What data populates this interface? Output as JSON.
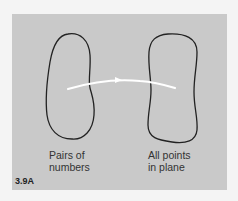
{
  "figure": {
    "number": "3.9A",
    "background_color": "#c9c9c9",
    "outline_color": "#222222",
    "arrow_color": "#ffffff"
  },
  "left_set": {
    "label_line1": "Pairs of",
    "label_line2": "numbers"
  },
  "right_set": {
    "label_line1": "All points",
    "label_line2": "in plane"
  }
}
